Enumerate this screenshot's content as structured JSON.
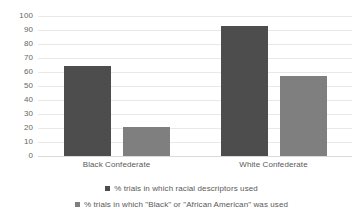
{
  "chart_data": {
    "type": "bar",
    "title": "",
    "xlabel": "",
    "ylabel": "",
    "categories": [
      "Black Confederate",
      "White Confederate"
    ],
    "series": [
      {
        "name": "% trials in which racial descriptors used",
        "color": "#4d4d4d",
        "values": [
          64,
          93
        ]
      },
      {
        "name": "% trials in which \"Black\" or \"African American\" was used",
        "color": "#7f7f7f",
        "values": [
          21,
          57
        ]
      }
    ],
    "ylim": [
      0,
      100
    ],
    "ytick_labels": [
      "0",
      "10",
      "20",
      "30",
      "40",
      "50",
      "60",
      "70",
      "80",
      "90",
      "100"
    ],
    "ytick_values": [
      0,
      10,
      20,
      30,
      40,
      50,
      60,
      70,
      80,
      90,
      100
    ],
    "grid": true,
    "grid_color": "#e8e8e8",
    "legend_position": "bottom",
    "background_color": "#ffffff"
  }
}
